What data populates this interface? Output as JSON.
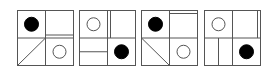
{
  "diagram": {
    "stroke_color": "#555555",
    "fill_black": "#000000",
    "fill_white": "#ffffff",
    "panel_size": {
      "w": 56,
      "h": 55
    },
    "panels": [
      {
        "x": 17,
        "y": 10,
        "quadrants": {
          "top_left": {
            "shape": "black-dot"
          },
          "top_right": {
            "shape": "horizontal-line",
            "position": "near-bottom"
          },
          "bottom_left": {
            "shape": "diagonal-line",
            "direction": "bottom-left-to-top-right"
          },
          "bottom_right": {
            "shape": "white-circle"
          }
        }
      },
      {
        "x": 79,
        "y": 10,
        "quadrants": {
          "top_left": {
            "shape": "white-circle"
          },
          "top_right": {
            "shape": "vertical-line",
            "position": "near-left"
          },
          "bottom_left": {
            "shape": "horizontal-line",
            "position": "middle"
          },
          "bottom_right": {
            "shape": "black-dot"
          }
        }
      },
      {
        "x": 141,
        "y": 10,
        "quadrants": {
          "top_left": {
            "shape": "black-dot"
          },
          "top_right": {
            "shape": "horizontal-line",
            "position": "near-top"
          },
          "bottom_left": {
            "shape": "diagonal-line",
            "direction": "top-left-to-bottom-right"
          },
          "bottom_right": {
            "shape": "white-circle"
          }
        }
      },
      {
        "x": 204,
        "y": 10,
        "quadrants": {
          "top_left": {
            "shape": "white-circle"
          },
          "top_right": {
            "shape": "vertical-line",
            "position": "near-right"
          },
          "bottom_left": {
            "shape": "vertical-line",
            "position": "middle"
          },
          "bottom_right": {
            "shape": "black-dot"
          }
        }
      }
    ]
  }
}
